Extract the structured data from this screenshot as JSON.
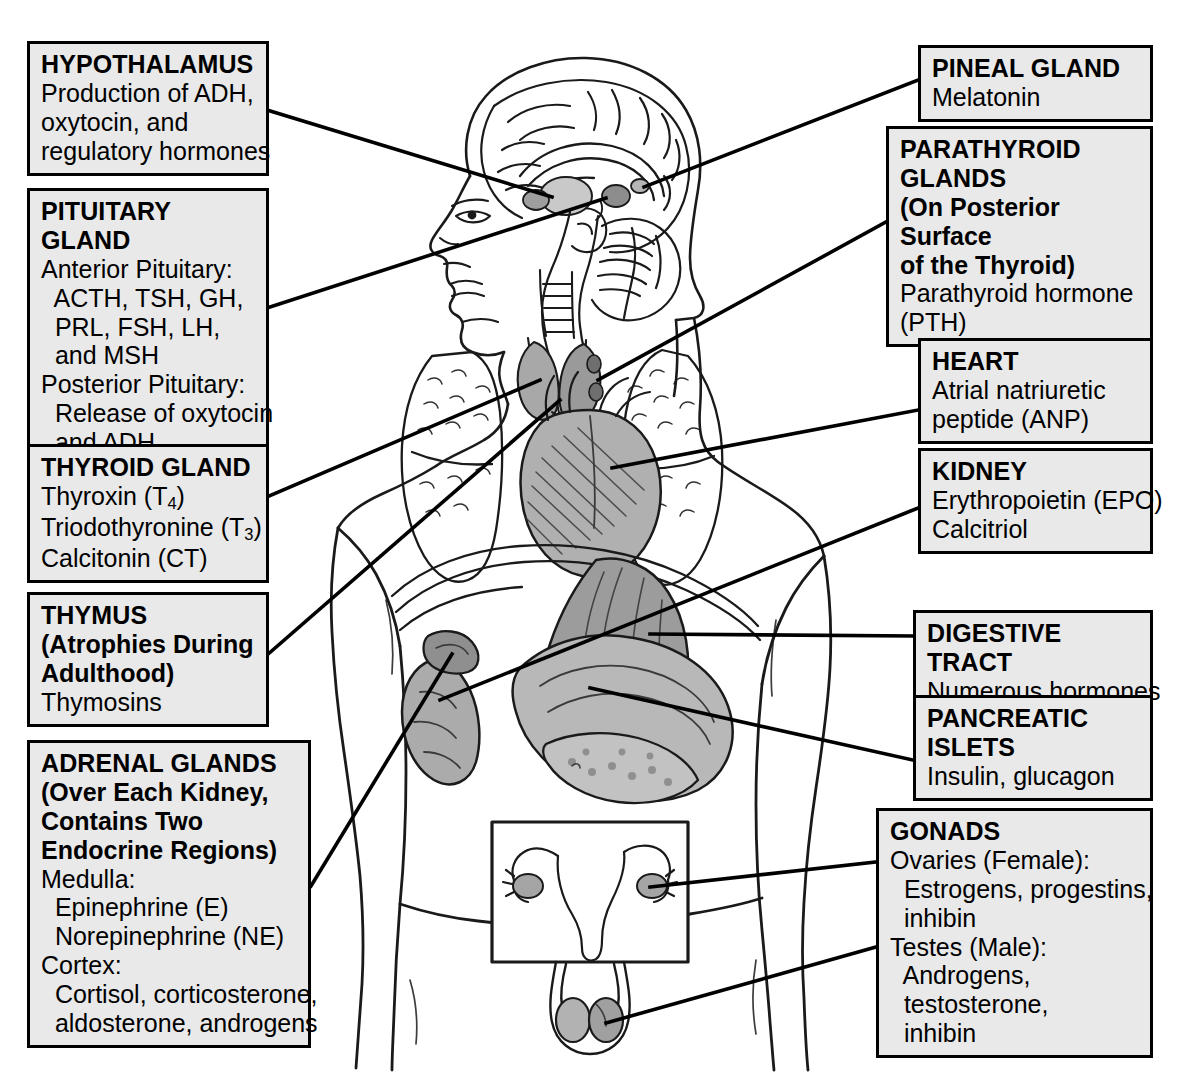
{
  "figure": {
    "background_color": "#ffffff",
    "box_fill_color": "#e9e9e9",
    "box_border_color": "#000000",
    "leader_line_color": "#000000",
    "artwork_name": "human-body-sagittal-and-anterior-endocrine-organs"
  },
  "left_boxes": [
    {
      "name": "hypothalamus",
      "title": "HYPOTHALAMUS",
      "lines": [
        "Production of ADH,",
        "oxytocin, and",
        "regulatory hormones"
      ]
    },
    {
      "name": "pituitary-gland",
      "title": "PITUITARY GLAND",
      "lines": [
        "Anterior Pituitary:",
        "  ACTH, TSH, GH,",
        "  PRL, FSH, LH,",
        "  and MSH",
        "Posterior Pituitary:",
        "  Release of oxytocin",
        "  and ADH"
      ]
    },
    {
      "name": "thyroid-gland",
      "title": "THYROID GLAND",
      "lines": [
        "Thyroxin (T4)",
        "Triodothyronine (T3)",
        "Calcitonin (CT)"
      ]
    },
    {
      "name": "thymus",
      "title": "THYMUS",
      "subtitle": [
        "(Atrophies During",
        "Adulthood)"
      ],
      "lines": [
        "Thymosins"
      ]
    },
    {
      "name": "adrenal-glands",
      "title": "ADRENAL GLANDS",
      "subtitle": [
        "(Over Each Kidney,",
        "Contains Two",
        "Endocrine Regions)"
      ],
      "lines": [
        "Medulla:",
        "  Epinephrine (E)",
        "  Norepinephrine (NE)",
        "Cortex:",
        "  Cortisol, corticosterone,",
        "  aldosterone, androgens"
      ]
    }
  ],
  "right_boxes": [
    {
      "name": "pineal-gland",
      "title": "PINEAL GLAND",
      "lines": [
        "Melatonin"
      ]
    },
    {
      "name": "parathyroid-glands",
      "title_lines": [
        "PARATHYROID",
        "GLANDS"
      ],
      "subtitle": [
        "(On Posterior Surface",
        "of the Thyroid)"
      ],
      "lines": [
        "Parathyroid hormone",
        "(PTH)"
      ]
    },
    {
      "name": "heart",
      "title": "HEART",
      "lines": [
        "Atrial natriuretic",
        "peptide (ANP)"
      ]
    },
    {
      "name": "kidney",
      "title": "KIDNEY",
      "lines": [
        "Erythropoietin (EPO)",
        "Calcitriol"
      ]
    },
    {
      "name": "digestive-tract",
      "title": "DIGESTIVE TRACT",
      "lines": [
        "Numerous hormones"
      ]
    },
    {
      "name": "pancreatic-islets",
      "title_lines": [
        "PANCREATIC",
        "ISLETS"
      ],
      "lines": [
        "Insulin, glucagon"
      ]
    },
    {
      "name": "gonads",
      "title": "GONADS",
      "lines": [
        "Ovaries (Female):",
        "  Estrogens, progestins,",
        "  inhibin",
        "Testes (Male):",
        "  Androgens,",
        "  testosterone,",
        "  inhibin"
      ]
    }
  ],
  "thyroid_subscripts": {
    "t4": "4",
    "t3": "3"
  }
}
